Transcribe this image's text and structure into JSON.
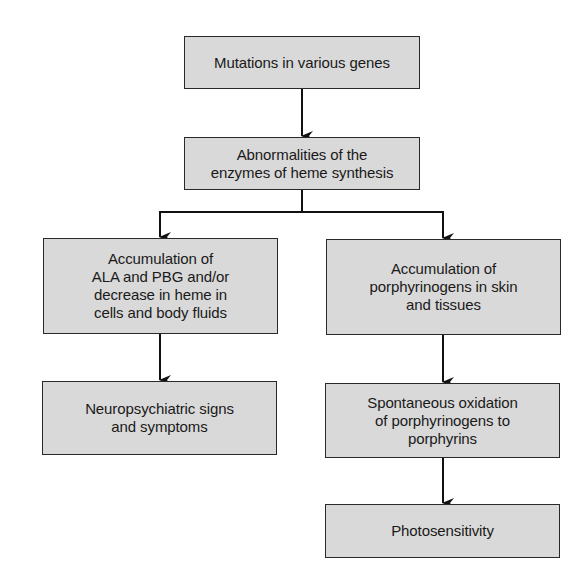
{
  "diagram": {
    "type": "flowchart",
    "colors": {
      "box_fill": "#d9d9d9",
      "box_border": "#2a2a2a",
      "arrow": "#111111",
      "background": "#ffffff"
    },
    "nodes": [
      {
        "id": "mutations",
        "label": "Mutations in various genes"
      },
      {
        "id": "enzyme_abnormalities",
        "label": "Abnormalities of the\nenzymes of heme synthesis"
      },
      {
        "id": "ala_pbg_accumulation",
        "label": "Accumulation of\nALA and PBG and/or\ndecrease in heme in\ncells and body fluids"
      },
      {
        "id": "porphyrinogen_accumulation",
        "label": "Accumulation of\nporphyrinogens in skin\nand tissues"
      },
      {
        "id": "neuropsychiatric",
        "label": "Neuropsychiatric signs\nand symptoms"
      },
      {
        "id": "oxidation",
        "label": "Spontaneous oxidation\nof porphyrinogens to\nporphyrins"
      },
      {
        "id": "photosensitivity",
        "label": "Photosensitivity"
      }
    ],
    "edges": [
      {
        "from": "mutations",
        "to": "enzyme_abnormalities"
      },
      {
        "from": "enzyme_abnormalities",
        "to": "ala_pbg_accumulation"
      },
      {
        "from": "enzyme_abnormalities",
        "to": "porphyrinogen_accumulation"
      },
      {
        "from": "ala_pbg_accumulation",
        "to": "neuropsychiatric"
      },
      {
        "from": "porphyrinogen_accumulation",
        "to": "oxidation"
      },
      {
        "from": "oxidation",
        "to": "photosensitivity"
      }
    ]
  }
}
